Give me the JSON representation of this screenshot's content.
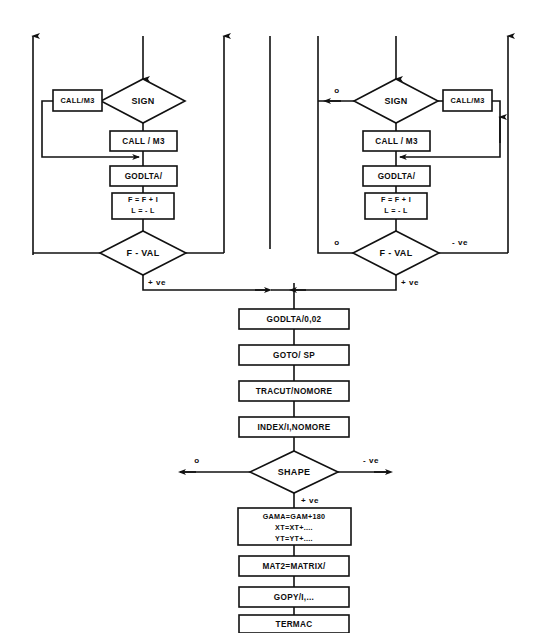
{
  "diagram": {
    "type": "flowchart",
    "background_color": "#ffffff",
    "line_color": "#111111",
    "text_color": "#0d0d0d"
  },
  "left_branch": {
    "sign_decision": "SIGN",
    "call_loop_box": "CALL/M3",
    "call_box": "CALL / M3",
    "godlta_box": "GODLTA/",
    "assign_box_line1": "F = F + I",
    "assign_box_line2": "L = - L",
    "fval_decision": "F - VAL",
    "fval_label_down": "+ ve"
  },
  "right_branch": {
    "sign_decision": "SIGN",
    "sign_label_left": "o",
    "call_loop_box": "CALL/M3",
    "call_box": "CALL / M3",
    "godlta_box": "GODLTA/",
    "assign_box_line1": "F = F + I",
    "assign_box_line2": "L = - L",
    "fval_decision": "F - VAL",
    "fval_label_left": "o",
    "fval_label_right": "- ve",
    "fval_label_down": "+ ve"
  },
  "main_sequence": {
    "boxes": [
      {
        "label": "GODLTA/0,02",
        "name": "godlta-params-box"
      },
      {
        "label": "GOTO/ SP",
        "name": "goto-sp-box"
      },
      {
        "label": "TRACUT/NOMORE",
        "name": "tracut-nomore-box"
      },
      {
        "label": "INDEX/I,NOMORE",
        "name": "index-nomore-box"
      }
    ],
    "shape_decision": "SHAPE",
    "shape_label_left": "o",
    "shape_label_right": "- ve",
    "shape_label_down": "+ ve",
    "gama_box": {
      "line1": "GAMA=GAM+180",
      "line2": "XT=XT+....",
      "line3": "YT=YT+...."
    },
    "tail_boxes": [
      {
        "label": "MAT2=MATRIX/",
        "name": "mat2-matrix-box"
      },
      {
        "label": "GOPY/I,...",
        "name": "gopy-box"
      },
      {
        "label": "TERMAC",
        "name": "termac-box"
      }
    ]
  },
  "connectors": {
    "top_entries": [
      {
        "name": "far-left-up-arrow",
        "direction": "up"
      },
      {
        "name": "left-outer-down-arrow",
        "direction": "down"
      },
      {
        "name": "left-inner-up-arrow",
        "direction": "up"
      },
      {
        "name": "left-center-plain",
        "direction": "none"
      },
      {
        "name": "right-center-plain",
        "direction": "none"
      },
      {
        "name": "right-inner-down-arrow",
        "direction": "down"
      },
      {
        "name": "far-right-up-arrow",
        "direction": "up"
      }
    ]
  }
}
